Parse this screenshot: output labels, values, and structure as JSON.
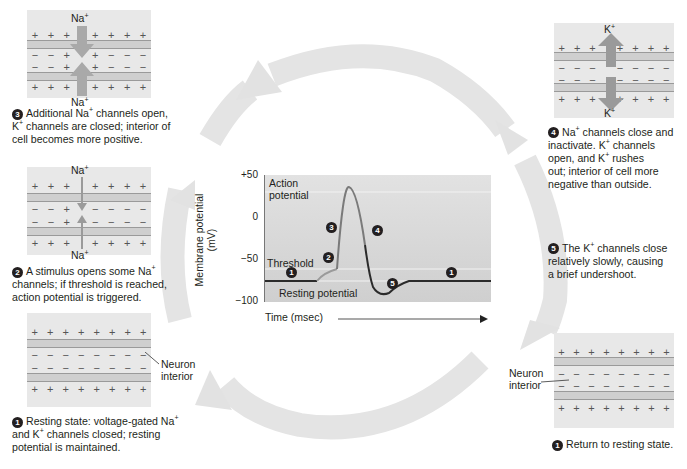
{
  "diagram": {
    "type": "cycle"
  },
  "stages": [
    {
      "id": "1a",
      "number": "1",
      "text_html": "Resting state: voltage-gated Na<sup>+</sup><br>and K<sup>+</sup> channels closed; resting<br>potential is maintained.",
      "label": "Neuron interior"
    },
    {
      "id": "2",
      "number": "2",
      "text_html": "A stimulus opens some Na<sup>+</sup><br>channels; if threshold is reached,<br>action potential is triggered.",
      "ion_top": "Na+",
      "ion_bottom": "Na+"
    },
    {
      "id": "3",
      "number": "3",
      "text_html": "Additional Na<sup>+</sup> channels open,<br>K<sup>+</sup> channels are closed; interior of<br>cell becomes more positive.",
      "ion_top": "Na+",
      "ion_bottom": "Na+"
    },
    {
      "id": "4",
      "number": "4",
      "text_html": "Na<sup>+</sup> channels close and<br>inactivate. K<sup>+</sup> channels<br>open, and K<sup>+</sup> rushes<br>out; interior of cell more<br>negative than outside.",
      "ion_top": "K+",
      "ion_bottom": "K+"
    },
    {
      "id": "5",
      "number": "5",
      "text_html": "The K<sup>+</sup> channels close<br>relatively slowly, causing<br>a brief undershoot."
    },
    {
      "id": "1b",
      "number": "1",
      "text_html": "Return to resting state.",
      "label": "Neuron interior"
    }
  ],
  "membrane": {
    "plus": "+",
    "minus": "−"
  },
  "graph": {
    "ylabel_line1": "Membrane potential",
    "ylabel_line2": "(mV)",
    "xlabel": "Time (msec)",
    "ticks": [
      "+50",
      "0",
      "−50",
      "−100"
    ],
    "annotations": {
      "action_potential_1": "Action",
      "action_potential_2": "potential",
      "threshold": "Threshold",
      "resting": "Resting potential"
    },
    "markers": [
      "1",
      "2",
      "3",
      "4",
      "5",
      "1"
    ]
  },
  "chart_data": {
    "type": "line",
    "title": "",
    "xlabel": "Time (msec)",
    "ylabel": "Membrane potential (mV)",
    "ylim": [
      -100,
      50
    ],
    "yticks": [
      50,
      0,
      -50,
      -100
    ],
    "reference_lines": {
      "action_potential": 30,
      "threshold": -55,
      "resting": -70
    },
    "series": [
      {
        "name": "membrane potential",
        "x": [
          0,
          1,
          1.5,
          2,
          2.3,
          2.7,
          3,
          3.3,
          4,
          4.8,
          8
        ],
        "y": [
          -70,
          -70,
          -60,
          -55,
          30,
          0,
          -60,
          -85,
          -82,
          -70,
          -70
        ]
      }
    ],
    "legend": "none",
    "grid": false
  },
  "colors": {
    "panel_bg": "#e8e8e8",
    "membrane": "#cfcfcf",
    "arrow": "#e2e2e2",
    "graph_bg": "#d6d6d6",
    "trace": "#2b2b2b",
    "rising_trace": "#8a8a8a"
  }
}
